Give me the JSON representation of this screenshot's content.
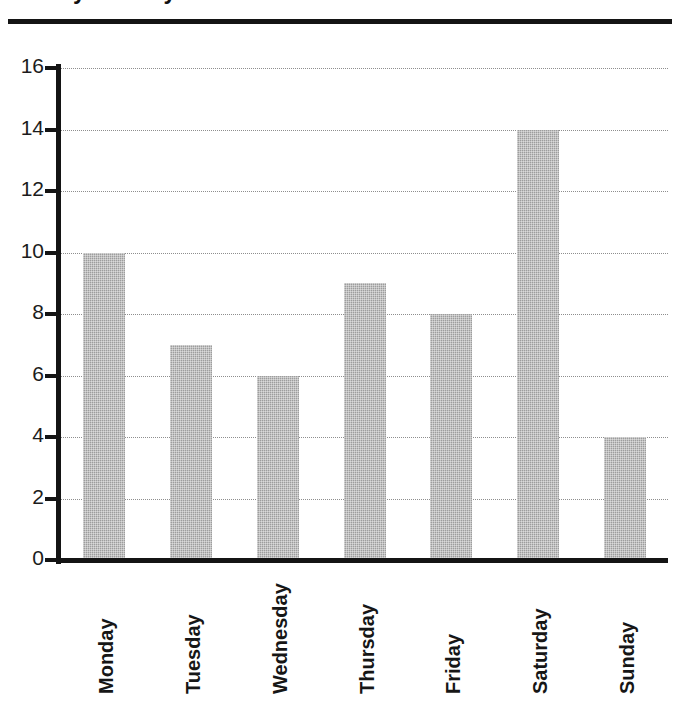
{
  "figure": {
    "title_fragment": "Daily Activity",
    "rule": "horizontal-rule"
  },
  "chart_data": {
    "type": "bar",
    "title": "",
    "xlabel": "",
    "ylabel": "",
    "categories": [
      "Monday",
      "Tuesday",
      "Wednesday",
      "Thursday",
      "Friday",
      "Saturday",
      "Sunday"
    ],
    "values": [
      10,
      7,
      6,
      9,
      8,
      14,
      4
    ],
    "ylim": [
      0,
      16
    ],
    "ytick_labels": [
      "0",
      "2",
      "4",
      "6",
      "8",
      "10",
      "12",
      "14",
      "16"
    ],
    "ytick_values": [
      0,
      2,
      4,
      6,
      8,
      10,
      12,
      14,
      16
    ],
    "grid": true,
    "grid_style": "dotted",
    "legend": false,
    "bar_color": "#9d9d9d",
    "axis_color": "#141414",
    "grid_color": "#8e8e8e",
    "xtick_rotation": 90
  }
}
